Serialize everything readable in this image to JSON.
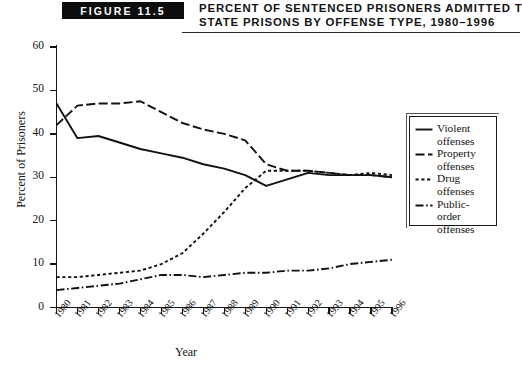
{
  "figure": {
    "badge_label": "FIGURE 11.5",
    "title_line1": "Percent of Sentenced Prisoners Admitted to",
    "title_line2": "State Prisons by Offense Type, 1980–1996"
  },
  "axes": {
    "y_axis_title": "Percent of Prisoners",
    "x_axis_title": "Year",
    "y_ticks": [
      "0",
      "10",
      "20",
      "30",
      "40",
      "50",
      "60"
    ],
    "x_ticks": [
      "1980",
      "1981",
      "1982",
      "1983",
      "1984",
      "1985",
      "1986",
      "1987",
      "1988",
      "1989",
      "1990",
      "1991",
      "1992",
      "1993",
      "1994",
      "1995",
      "1996"
    ]
  },
  "legend": {
    "items": [
      {
        "name": "violent",
        "label_line1": "Violent",
        "label_line2": "offenses",
        "style": "solid",
        "color": "#111111"
      },
      {
        "name": "property",
        "label_line1": "Property",
        "label_line2": "offenses",
        "style": "longdash",
        "color": "#111111"
      },
      {
        "name": "drug",
        "label_line1": "Drug",
        "label_line2": "offenses",
        "style": "shortdash",
        "color": "#111111"
      },
      {
        "name": "public-order",
        "label_line1": "Public-order",
        "label_line2": "offenses",
        "style": "dashdot",
        "color": "#111111"
      }
    ]
  },
  "chart_data": {
    "type": "line",
    "title": "Percent of Sentenced Prisoners Admitted to State Prisons by Offense Type, 1980–1996",
    "xlabel": "Year",
    "ylabel": "Percent of Prisoners",
    "x": [
      1980,
      1981,
      1982,
      1983,
      1984,
      1985,
      1986,
      1987,
      1988,
      1989,
      1990,
      1991,
      1992,
      1993,
      1994,
      1995,
      1996
    ],
    "xlim": [
      1980,
      1996
    ],
    "ylim": [
      0,
      60
    ],
    "y_tick_step": 10,
    "grid": false,
    "legend_position": "right-outside",
    "series": [
      {
        "name": "Violent offenses",
        "style": "solid",
        "color": "#111111",
        "values": [
          47.0,
          39.0,
          39.5,
          38.0,
          36.5,
          35.5,
          34.5,
          33.0,
          32.0,
          30.5,
          28.0,
          29.5,
          31.0,
          30.5,
          30.5,
          30.5,
          30.0
        ]
      },
      {
        "name": "Property offenses",
        "style": "longdash",
        "color": "#111111",
        "values": [
          42.0,
          46.5,
          47.0,
          47.0,
          47.5,
          45.0,
          42.5,
          41.0,
          40.0,
          38.5,
          33.0,
          31.5,
          31.5,
          31.0,
          30.5,
          30.5,
          30.0
        ]
      },
      {
        "name": "Drug offenses",
        "style": "shortdash",
        "color": "#111111",
        "values": [
          7.0,
          7.0,
          7.5,
          8.0,
          8.5,
          10.0,
          12.5,
          17.0,
          22.0,
          27.5,
          31.5,
          31.5,
          31.5,
          31.0,
          30.5,
          31.0,
          30.5
        ]
      },
      {
        "name": "Public-order offenses",
        "style": "dashdot",
        "color": "#111111",
        "values": [
          4.0,
          4.5,
          5.0,
          5.5,
          6.5,
          7.5,
          7.5,
          7.0,
          7.5,
          8.0,
          8.0,
          8.5,
          8.5,
          9.0,
          10.0,
          10.5,
          11.0
        ]
      }
    ]
  }
}
